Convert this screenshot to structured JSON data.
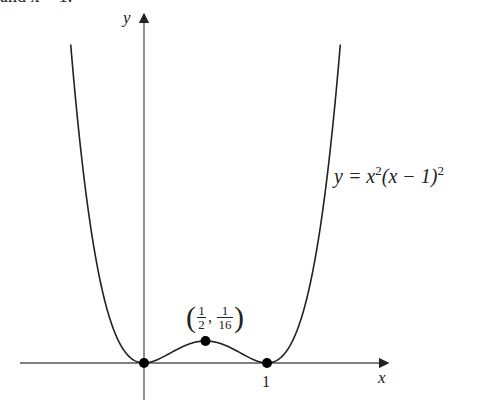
{
  "header_fragment": "and x = 1.",
  "chart_data": {
    "type": "line",
    "title": "",
    "function": "y = x^2(x - 1)^2",
    "curve_label": "y = x²(x − 1)²",
    "xlabel": "x",
    "ylabel": "y",
    "x_ticks": [
      {
        "value": 1,
        "label": "1"
      }
    ],
    "points": [
      {
        "x": 0,
        "y": 0,
        "label": ""
      },
      {
        "x": 0.5,
        "y": 0.0625,
        "label": "(1/2, 1/16)"
      },
      {
        "x": 1,
        "y": 0,
        "label": ""
      }
    ],
    "xlim": [
      -1.0,
      2.0
    ],
    "grid": false,
    "legend": "none",
    "colors": {
      "curve": "#222222",
      "axis": "#555555",
      "point": "#000000"
    }
  },
  "labels": {
    "y_axis": "y",
    "x_axis": "x",
    "tick_1": "1",
    "curve": "y = x",
    "curve_exp1": "2",
    "curve_mid": "(x − 1)",
    "curve_exp2": "2",
    "pt_num1": "1",
    "pt_den1": "2",
    "pt_num2": "1",
    "pt_den2": "16"
  }
}
